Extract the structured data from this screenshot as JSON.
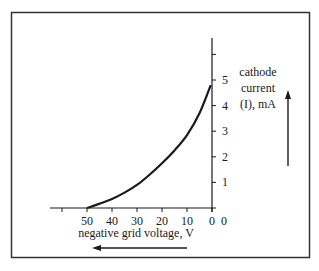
{
  "chart_data": {
    "type": "line",
    "title": "",
    "xlabel": "negative grid voltage, V",
    "ylabel": [
      "cathode",
      "current",
      "(I), mA"
    ],
    "x_ticks": [
      60,
      50,
      40,
      30,
      20,
      10,
      0
    ],
    "x_tick_labels": [
      "",
      "50",
      "40",
      "30",
      "20",
      "10",
      "0"
    ],
    "y_ticks": [
      0,
      1,
      2,
      3,
      4,
      5,
      6
    ],
    "y_tick_labels": [
      "",
      "1",
      "2",
      "3",
      "4",
      "5",
      ""
    ],
    "xlim": [
      63,
      0
    ],
    "ylim": [
      0,
      6.7
    ],
    "grid": false,
    "legend": "none",
    "series": [
      {
        "name": "cathode current",
        "x": [
          50,
          45,
          40,
          35,
          30,
          25,
          20,
          15,
          10,
          5,
          0.5
        ],
        "y": [
          0,
          0.17,
          0.35,
          0.6,
          0.9,
          1.3,
          1.75,
          2.25,
          2.85,
          3.7,
          4.8
        ]
      }
    ],
    "annotations": [
      {
        "type": "arrow",
        "direction": "left",
        "meaning": "increasing negative grid voltage"
      },
      {
        "type": "arrow",
        "direction": "up",
        "meaning": "increasing cathode current"
      }
    ]
  },
  "colors": {
    "ink": "#1a1a1a",
    "frame": "#333333",
    "background": "#ffffff"
  }
}
